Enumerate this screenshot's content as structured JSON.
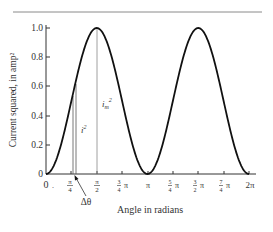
{
  "chart_data": {
    "type": "line",
    "title": "",
    "xlabel": "Angle in radians",
    "ylabel": "Current squared, in amp²",
    "xlim": [
      0,
      6.2832
    ],
    "ylim": [
      0,
      1.0
    ],
    "grid": false,
    "legend": null,
    "x_ticks": [
      {
        "value": 0,
        "label": "0"
      },
      {
        "value": 0.7854,
        "label": "π/4"
      },
      {
        "value": 1.5708,
        "label": "π/2"
      },
      {
        "value": 2.3562,
        "label": "3/4 π"
      },
      {
        "value": 3.1416,
        "label": "π"
      },
      {
        "value": 3.927,
        "label": "5/4 π"
      },
      {
        "value": 4.7124,
        "label": "3/2 π"
      },
      {
        "value": 5.4978,
        "label": "7/4 π"
      },
      {
        "value": 6.2832,
        "label": "2π"
      }
    ],
    "y_ticks": [
      {
        "value": 0,
        "label": "0"
      },
      {
        "value": 0.2,
        "label": "0.2"
      },
      {
        "value": 0.4,
        "label": "0.4"
      },
      {
        "value": 0.6,
        "label": "0.6"
      },
      {
        "value": 0.8,
        "label": "0.8"
      },
      {
        "value": 1.0,
        "label": "1.0"
      }
    ],
    "series": [
      {
        "name": "i²",
        "function": "sin²(θ)",
        "x": [
          0,
          0.3927,
          0.7854,
          1.1781,
          1.5708,
          1.9635,
          2.3562,
          2.7489,
          3.1416,
          3.5343,
          3.927,
          4.3197,
          4.7124,
          5.1051,
          5.4978,
          5.8905,
          6.2832
        ],
        "values": [
          0,
          0.146,
          0.5,
          0.854,
          1.0,
          0.854,
          0.5,
          0.146,
          0,
          0.146,
          0.5,
          0.854,
          1.0,
          0.854,
          0.5,
          0.146,
          0
        ]
      }
    ],
    "annotations": [
      {
        "type": "vertical_line",
        "x": 0.82,
        "y_to": 0.53,
        "label": ""
      },
      {
        "type": "vertical_line",
        "x": 0.91,
        "y_to": 0.62,
        "label": "i²"
      },
      {
        "type": "vertical_line",
        "x": 1.5708,
        "y_to": 1.0,
        "label": "i_m²"
      },
      {
        "type": "arrow_label",
        "label": "Δθ",
        "points_to_x": 0.87
      }
    ]
  },
  "labels": {
    "xlabel": "Angle in radians",
    "ylabel": "Current squared, in amp²",
    "i_sq": "i",
    "i_sq_exp": "2",
    "im_sq_base": "i",
    "im_sq_sub": "m",
    "im_sq_exp": "2",
    "delta_theta": "Δθ",
    "origin_zero_x": "0",
    "origin_dot": ".",
    "y": [
      "0",
      "0.2",
      "0.4",
      "0.6",
      "0.8",
      "1.0"
    ],
    "x_pi_over_4_num": "π",
    "x_pi_over_4_den": "4",
    "x_pi_over_2_num": "π",
    "x_pi_over_2_den": "2",
    "x_3_4_num": "3",
    "x_3_4_den": "4",
    "x_3_4_pi": "π",
    "x_pi": "π",
    "x_5_4_num": "5",
    "x_5_4_den": "4",
    "x_5_4_pi": "π",
    "x_3_2_num": "3",
    "x_3_2_den": "2",
    "x_3_2_pi": "π",
    "x_7_4_num": "7",
    "x_7_4_den": "4",
    "x_7_4_pi": "π",
    "x_2pi": "2π"
  }
}
